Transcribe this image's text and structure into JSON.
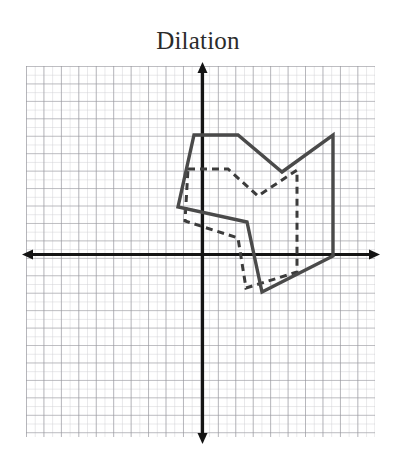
{
  "figure": {
    "title": "Dilation",
    "type": "coordinate-grid-figure",
    "background_color": "#ffffff"
  },
  "grid": {
    "minor_color": "#c9c9cd",
    "major_color": "#8e8e96",
    "minor_step_px": 8.72,
    "major_every": 2,
    "left_px": 26,
    "right_px": 375,
    "top_px": 66,
    "bottom_px": 437
  },
  "axes": {
    "color": "#1a1a1a",
    "origin_px": [
      202,
      254
    ],
    "x_axis_label": "",
    "y_axis_label": "",
    "x_arrow_left_px": 22,
    "x_arrow_right_px": 380,
    "y_arrow_top_px": 62,
    "y_arrow_bottom_px": 444,
    "unit_px": 17.44
  },
  "chart_data": {
    "type": "line",
    "title": "Dilation",
    "xlabel": "",
    "ylabel": "",
    "grid": true,
    "legend": "none",
    "xlim": [
      -10.1,
      9.9
    ],
    "ylim": [
      -10.5,
      10.8
    ],
    "series": [
      {
        "name": "image-polygon-solid",
        "style": "solid",
        "color": "#4a4a4a",
        "width_px": 3.4,
        "closed": true,
        "points_px": [
          [
            194,
            135
          ],
          [
            238,
            135
          ],
          [
            282,
            172
          ],
          [
            333,
            135
          ],
          [
            333,
            256
          ],
          [
            262,
            292
          ],
          [
            247,
            222
          ],
          [
            178,
            207
          ]
        ],
        "points_units": [
          [
            -0.5,
            6.8
          ],
          [
            2.1,
            6.8
          ],
          [
            4.6,
            4.7
          ],
          [
            7.5,
            6.8
          ],
          [
            7.5,
            -0.1
          ],
          [
            3.4,
            -2.2
          ],
          [
            2.6,
            1.8
          ],
          [
            -1.4,
            2.7
          ]
        ]
      },
      {
        "name": "preimage-polygon-dashed",
        "style": "dashed",
        "color": "#3c3c3c",
        "width_px": 3.0,
        "dash_px": [
          7,
          5
        ],
        "closed": true,
        "points_px": [
          [
            188,
            169
          ],
          [
            228,
            169
          ],
          [
            258,
            196
          ],
          [
            297,
            170
          ],
          [
            297,
            272
          ],
          [
            246,
            288
          ],
          [
            238,
            238
          ],
          [
            185,
            221
          ]
        ],
        "points_units": [
          [
            -0.8,
            4.9
          ],
          [
            1.5,
            4.9
          ],
          [
            3.2,
            3.3
          ],
          [
            5.4,
            4.8
          ],
          [
            5.4,
            -1.0
          ],
          [
            2.5,
            -2.0
          ],
          [
            2.1,
            0.9
          ],
          [
            -1.0,
            1.9
          ]
        ]
      }
    ]
  }
}
